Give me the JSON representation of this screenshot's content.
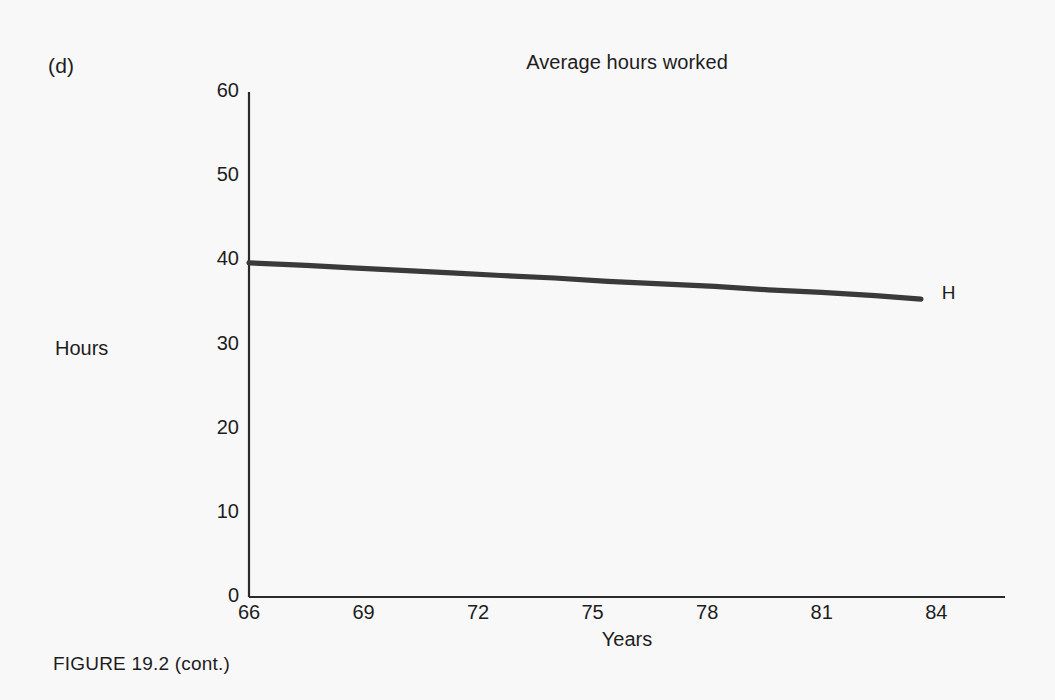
{
  "figure": {
    "panel_label": "(d)",
    "caption": "FIGURE 19.2 (cont.)"
  },
  "colors": {
    "background": "#f8f8f9",
    "ink": "#1d1d1d",
    "axis": "#2b2b2b",
    "series": "#3a3a3a"
  },
  "chart_data": {
    "type": "line",
    "title": "Average hours worked",
    "xlabel": "Years",
    "ylabel": "Hours",
    "xlim": [
      66,
      85.8
    ],
    "ylim": [
      0,
      60
    ],
    "xticks": [
      66,
      69,
      72,
      75,
      78,
      81,
      84
    ],
    "xtick_labels": [
      "66",
      "69",
      "72",
      "75",
      "78",
      "81",
      "84"
    ],
    "yticks": [
      0,
      10,
      20,
      30,
      40,
      50,
      60
    ],
    "ytick_labels": [
      "0",
      "10",
      "20",
      "30",
      "40",
      "50",
      "60"
    ],
    "grid": false,
    "legend": "none",
    "series": [
      {
        "name": "H",
        "label": "H",
        "endpoint_label": "H",
        "x": [
          66.0,
          67.5,
          68.7,
          70.0,
          71.3,
          72.6,
          74.0,
          75.4,
          76.8,
          78.2,
          79.6,
          81.0,
          82.4,
          83.6
        ],
        "values": [
          39.7,
          39.4,
          39.1,
          38.8,
          38.5,
          38.2,
          37.9,
          37.5,
          37.2,
          36.9,
          36.5,
          36.2,
          35.8,
          35.4
        ]
      }
    ],
    "annotations": [
      {
        "text": "H",
        "x": 84.3,
        "y": 36.0
      }
    ]
  }
}
